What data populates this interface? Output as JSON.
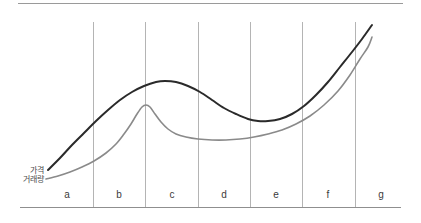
{
  "figure": {
    "background": "#ffffff",
    "width": 421,
    "height": 223
  },
  "chart_data": {
    "type": "line",
    "title": "",
    "xlabel": "",
    "ylabel": "",
    "grid": false,
    "legend_position": "inline-left",
    "xlim": [
      20,
      403
    ],
    "ylim": [
      207,
      3
    ],
    "categories": [
      "a",
      "b",
      "c",
      "d",
      "e",
      "f",
      "g"
    ],
    "phase_dividers_x": [
      93,
      145,
      198,
      250,
      302,
      355
    ],
    "phase_label_positions_x": [
      67,
      119,
      172,
      224,
      276,
      328,
      381
    ],
    "phase_label_y": 198,
    "axis": {
      "top_rule": {
        "x1": 18,
        "y1": 3,
        "x2": 403,
        "y2": 3
      },
      "bottom_rule": {
        "x1": 20,
        "y1": 207,
        "x2": 401,
        "y2": 207
      },
      "divider_top_y": 22,
      "divider_bottom_y": 207
    },
    "series": [
      {
        "name": "가격",
        "color": "#2a2a2a",
        "width": 2.0,
        "label_anchor": {
          "x": 44,
          "y": 170
        },
        "points": [
          [
            48,
            170
          ],
          [
            60,
            158
          ],
          [
            72,
            145
          ],
          [
            84,
            133
          ],
          [
            96,
            121
          ],
          [
            108,
            110
          ],
          [
            120,
            100
          ],
          [
            132,
            92
          ],
          [
            144,
            86
          ],
          [
            156,
            82
          ],
          [
            165,
            81
          ],
          [
            176,
            82
          ],
          [
            188,
            86
          ],
          [
            200,
            92
          ],
          [
            212,
            100
          ],
          [
            224,
            108
          ],
          [
            236,
            114
          ],
          [
            248,
            119
          ],
          [
            258,
            121
          ],
          [
            268,
            121
          ],
          [
            280,
            119
          ],
          [
            292,
            114
          ],
          [
            304,
            106
          ],
          [
            316,
            95
          ],
          [
            328,
            82
          ],
          [
            340,
            67
          ],
          [
            352,
            52
          ],
          [
            362,
            39
          ],
          [
            372,
            25
          ]
        ]
      },
      {
        "name": "거래량",
        "color": "#8a8a8a",
        "width": 1.6,
        "label_anchor": {
          "x": 44,
          "y": 179
        },
        "points": [
          [
            46,
            179
          ],
          [
            58,
            176
          ],
          [
            70,
            172
          ],
          [
            82,
            167
          ],
          [
            94,
            161
          ],
          [
            106,
            153
          ],
          [
            116,
            144
          ],
          [
            124,
            134
          ],
          [
            131,
            124
          ],
          [
            137,
            114
          ],
          [
            142,
            107
          ],
          [
            146,
            105
          ],
          [
            150,
            107
          ],
          [
            155,
            114
          ],
          [
            161,
            122
          ],
          [
            168,
            129
          ],
          [
            176,
            134
          ],
          [
            186,
            137
          ],
          [
            198,
            139
          ],
          [
            212,
            140
          ],
          [
            226,
            140
          ],
          [
            240,
            139
          ],
          [
            254,
            137
          ],
          [
            268,
            134
          ],
          [
            282,
            130
          ],
          [
            296,
            124
          ],
          [
            310,
            116
          ],
          [
            324,
            105
          ],
          [
            338,
            91
          ],
          [
            350,
            75
          ],
          [
            360,
            59
          ],
          [
            368,
            47
          ],
          [
            372,
            37
          ]
        ]
      }
    ]
  }
}
